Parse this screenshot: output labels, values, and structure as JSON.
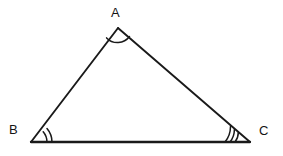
{
  "figure": {
    "type": "triangle-diagram",
    "background_color": "#ffffff",
    "stroke_color": "#1a1a1a"
  },
  "vertices": [
    {
      "id": "A",
      "label": "A",
      "x": 118,
      "y": 28,
      "label_x": 111,
      "label_y": 6,
      "arc_count": 1
    },
    {
      "id": "B",
      "label": "B",
      "x": 31,
      "y": 142,
      "label_x": 9,
      "label_y": 123,
      "arc_count": 2
    },
    {
      "id": "C",
      "label": "C",
      "x": 250,
      "y": 142,
      "label_x": 259,
      "label_y": 124,
      "arc_count": 3
    }
  ],
  "sides": [
    {
      "name": "AB",
      "from": "A",
      "to": "B"
    },
    {
      "name": "AC",
      "from": "A",
      "to": "C"
    },
    {
      "name": "BC",
      "from": "B",
      "to": "C"
    }
  ],
  "angle_marks": {
    "A": {
      "arcs": 1,
      "radii": [
        15
      ]
    },
    "B": {
      "arcs": 2,
      "radii": [
        16,
        21
      ]
    },
    "C": {
      "arcs": 3,
      "radii": [
        15,
        20,
        25
      ]
    }
  }
}
